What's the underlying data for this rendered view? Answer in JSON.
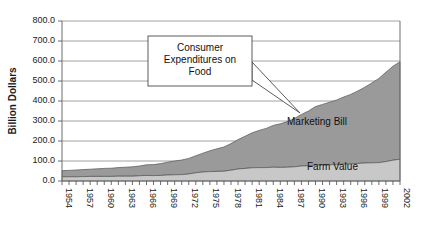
{
  "chart_data": {
    "type": "area",
    "stacked": true,
    "title": "",
    "xlabel": "",
    "ylabel": "Billion Dollars",
    "ylim": [
      0,
      800
    ],
    "ytick_labels": [
      "0.0",
      "100.0",
      "200.0",
      "300.0",
      "400.0",
      "500.0",
      "600.0",
      "700.0",
      "800.0"
    ],
    "ytick_values": [
      0,
      100,
      200,
      300,
      400,
      500,
      600,
      700,
      800
    ],
    "grid": true,
    "legend_position": "inline-annotation",
    "x": [
      1954,
      1955,
      1956,
      1957,
      1958,
      1959,
      1960,
      1961,
      1962,
      1963,
      1964,
      1965,
      1966,
      1967,
      1968,
      1969,
      1970,
      1971,
      1972,
      1973,
      1974,
      1975,
      1976,
      1977,
      1978,
      1979,
      1980,
      1981,
      1982,
      1983,
      1984,
      1985,
      1986,
      1987,
      1988,
      1989,
      1990,
      1991,
      1992,
      1993,
      1994,
      1995,
      1996,
      1997,
      1998,
      1999,
      2000,
      2001,
      2002
    ],
    "xtick_labels": [
      "1954",
      "1957",
      "1960",
      "1963",
      "1966",
      "1969",
      "1972",
      "1975",
      "1978",
      "1981",
      "1984",
      "1987",
      "1990",
      "1993",
      "1996",
      "1999",
      "2002"
    ],
    "xtick_values": [
      1954,
      1957,
      1960,
      1963,
      1966,
      1969,
      1972,
      1975,
      1978,
      1981,
      1984,
      1987,
      1990,
      1993,
      1996,
      1999,
      2002
    ],
    "series": [
      {
        "name": "Farm Value",
        "color": "#c8c8c8",
        "values": [
          21,
          21,
          21,
          22,
          23,
          23,
          23,
          23,
          24,
          24,
          24,
          26,
          28,
          27,
          28,
          30,
          31,
          32,
          35,
          41,
          45,
          47,
          48,
          49,
          54,
          60,
          63,
          66,
          67,
          67,
          69,
          68,
          69,
          71,
          75,
          76,
          80,
          80,
          81,
          82,
          84,
          85,
          88,
          90,
          91,
          92,
          97,
          104,
          109
        ]
      },
      {
        "name": "Marketing Bill",
        "color": "#9a9a9a",
        "values": [
          31,
          32,
          34,
          35,
          36,
          38,
          40,
          41,
          43,
          45,
          47,
          49,
          53,
          55,
          59,
          64,
          69,
          73,
          78,
          85,
          94,
          104,
          113,
          121,
          133,
          147,
          161,
          175,
          186,
          196,
          209,
          218,
          228,
          241,
          258,
          274,
          292,
          303,
          313,
          323,
          336,
          348,
          362,
          379,
          399,
          421,
          447,
          470,
          487
        ]
      }
    ],
    "totals_note": "Farm Value + Marketing Bill = Consumer Expenditures on Food"
  },
  "annotations": {
    "callout": {
      "lines": [
        "Consumer",
        "Expenditures on",
        "Food"
      ]
    },
    "series_labels": {
      "marketing_bill": "Marketing Bill",
      "farm_value": "Farm Value"
    }
  },
  "axis": {
    "y_title": "Billion Dollars"
  },
  "colors": {
    "farm_value": "#c8c8c8",
    "marketing_bill": "#9a9a9a",
    "grid": "#8c8c8c",
    "axis": "#6e6e6e",
    "text": "#1a1a1a",
    "background": "#ffffff"
  }
}
